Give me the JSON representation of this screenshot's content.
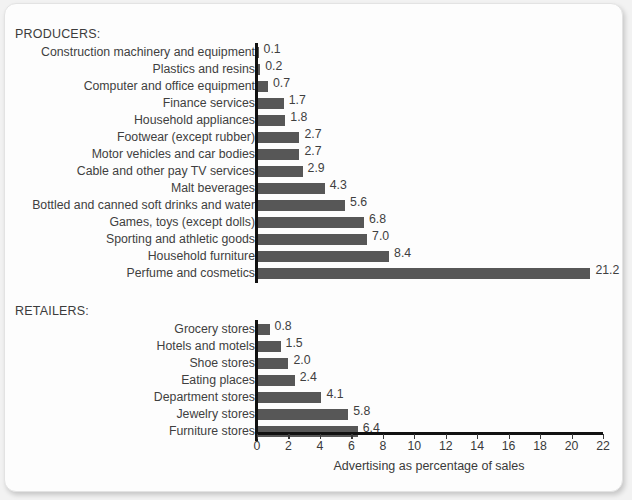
{
  "chart_data": {
    "type": "bar",
    "orientation": "horizontal",
    "title": "",
    "xlabel": "Advertising as percentage of sales",
    "ylabel": "",
    "xlim": [
      0,
      22
    ],
    "xticks": [
      0,
      2,
      4,
      6,
      8,
      10,
      12,
      14,
      16,
      18,
      20,
      22
    ],
    "grid": false,
    "legend": null,
    "bar_color": "#575757",
    "groups": [
      {
        "name": "PRODUCERS:",
        "categories": [
          "Construction machinery and equipment",
          "Plastics and resins",
          "Computer and office equipment",
          "Finance services",
          "Household appliances",
          "Footwear (except rubber)",
          "Motor vehicles and car bodies",
          "Cable and other pay TV services",
          "Malt beverages",
          "Bottled and canned soft drinks and water",
          "Games, toys (except dolls)",
          "Sporting and athletic goods",
          "Household furniture",
          "Perfume and cosmetics"
        ],
        "values": [
          0.1,
          0.2,
          0.7,
          1.7,
          1.8,
          2.7,
          2.7,
          2.9,
          4.3,
          5.6,
          6.8,
          7.0,
          8.4,
          21.2
        ],
        "labels": [
          "0.1",
          "0.2",
          "0.7",
          "1.7",
          "1.8",
          "2.7",
          "2.7",
          "2.9",
          "4.3",
          "5.6",
          "6.8",
          "7.0",
          "8.4",
          "21.2"
        ]
      },
      {
        "name": "RETAILERS:",
        "categories": [
          "Grocery stores",
          "Hotels and motels",
          "Shoe stores",
          "Eating places",
          "Department stores",
          "Jewelry stores",
          "Furniture stores"
        ],
        "values": [
          0.8,
          1.5,
          2.0,
          2.4,
          4.1,
          5.8,
          6.4
        ],
        "labels": [
          "0.8",
          "1.5",
          "2.0",
          "2.4",
          "4.1",
          "5.8",
          "6.4"
        ]
      }
    ]
  }
}
